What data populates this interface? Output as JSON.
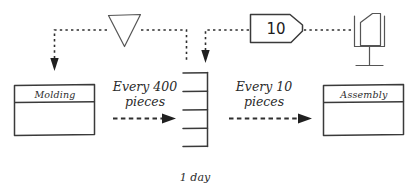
{
  "diagram": {
    "ink_color": "#3a3a3a",
    "text_color": "#2b2b2b"
  },
  "processes": [
    {
      "id": "molding",
      "label": "Molding"
    },
    {
      "id": "assembly",
      "label": "Assembly"
    }
  ],
  "supermarket": {
    "name": "supermarket",
    "shelf_count": 4,
    "time_label": "1 day"
  },
  "flow_labels": [
    {
      "id": "molding-to-supermarket",
      "line1": "Every 400",
      "line2": "pieces"
    },
    {
      "id": "supermarket-to-assembly",
      "line1": "Every 10",
      "line2": "pieces"
    }
  ],
  "symbols": {
    "load_leveling": {
      "name": "load-leveling-triangle",
      "label": ""
    },
    "kanban_card": {
      "name": "kanban-card",
      "value": "10"
    },
    "kanban_post": {
      "name": "kanban-post",
      "label": ""
    }
  },
  "connections": [
    {
      "id": "leveling-to-molding",
      "type": "information-dashed",
      "arrow": "down"
    },
    {
      "id": "leveling-to-supermarket",
      "type": "information-dashed",
      "arrow": "none"
    },
    {
      "id": "card-to-supermarket",
      "type": "information-dashed",
      "arrow": "down"
    },
    {
      "id": "post-to-card",
      "type": "information-dashed",
      "arrow": "none"
    },
    {
      "id": "molding-push",
      "type": "push-arrow",
      "arrow": "right"
    },
    {
      "id": "supermarket-push",
      "type": "push-arrow",
      "arrow": "right"
    }
  ]
}
